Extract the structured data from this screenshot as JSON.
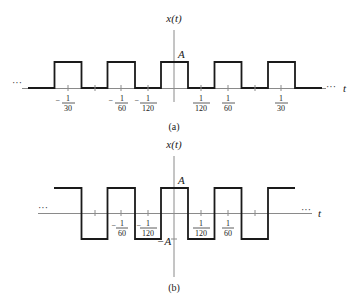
{
  "figure_a": {
    "y_label": "x(t)",
    "x_label": "t",
    "amplitude_label": "A",
    "caption": "(a)",
    "continuation": "···",
    "signal": "unipolar square wave, 0 to A",
    "ticks": [
      {
        "sign": "−",
        "num": "1",
        "den": "30"
      },
      {
        "sign": "−",
        "num": "1",
        "den": "60"
      },
      {
        "sign": "−",
        "num": "1",
        "den": "120"
      },
      {
        "sign": "",
        "num": "1",
        "den": "120"
      },
      {
        "sign": "",
        "num": "1",
        "den": "60"
      },
      {
        "sign": "",
        "num": "1",
        "den": "30"
      }
    ]
  },
  "figure_b": {
    "y_label": "x(t)",
    "x_label": "t",
    "amplitude_label": "A",
    "neg_amplitude_label": "−A",
    "caption": "(b)",
    "continuation": "···",
    "signal": "bipolar square wave, −A to A",
    "ticks": [
      {
        "sign": "−",
        "num": "1",
        "den": "60"
      },
      {
        "sign": "−",
        "num": "1",
        "den": "120"
      },
      {
        "sign": "",
        "num": "1",
        "den": "120"
      },
      {
        "sign": "",
        "num": "1",
        "den": "60"
      }
    ]
  },
  "colors": {
    "signal": "#1a1a1a",
    "axis": "#8a8a8a",
    "background": "#ffffff"
  }
}
